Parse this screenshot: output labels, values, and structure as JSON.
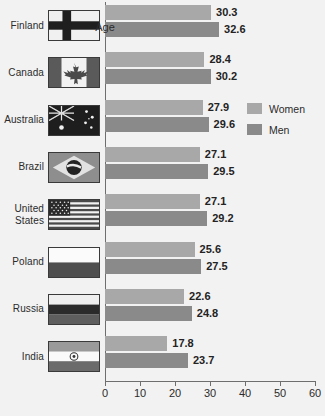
{
  "chart_data": {
    "type": "bar",
    "orientation": "horizontal",
    "title": "",
    "xlabel": "Age",
    "ylabel": "",
    "xlim": [
      0,
      60
    ],
    "xticks": [
      0,
      10,
      20,
      30,
      40,
      50,
      60
    ],
    "grid": false,
    "legend_position": "right-middle",
    "categories": [
      "Finland",
      "Canada",
      "Australia",
      "Brazil",
      "United States",
      "Poland",
      "Russia",
      "India"
    ],
    "series": [
      {
        "name": "Women",
        "color": "#a8a8a8",
        "values": [
          30.3,
          28.4,
          27.9,
          27.1,
          27.1,
          25.6,
          22.6,
          17.8
        ]
      },
      {
        "name": "Men",
        "color": "#8a8a8a",
        "values": [
          32.6,
          30.2,
          29.6,
          29.5,
          29.2,
          27.5,
          24.8,
          23.7
        ]
      }
    ]
  },
  "axis": {
    "x_title": "Age",
    "tick_labels": [
      "0",
      "10",
      "20",
      "30",
      "40",
      "50",
      "60"
    ]
  },
  "legend": {
    "items": [
      {
        "label": "Women",
        "color": "#a8a8a8"
      },
      {
        "label": "Men",
        "color": "#8a8a8a"
      }
    ]
  },
  "rows": [
    {
      "label": "Finland",
      "label_lines": [
        "Finland"
      ],
      "flag": "flag-finland",
      "women": "30.3",
      "men": "32.6"
    },
    {
      "label": "Canada",
      "label_lines": [
        "Canada"
      ],
      "flag": "flag-canada",
      "women": "28.4",
      "men": "30.2"
    },
    {
      "label": "Australia",
      "label_lines": [
        "Australia"
      ],
      "flag": "flag-australia",
      "women": "27.9",
      "men": "29.6"
    },
    {
      "label": "Brazil",
      "label_lines": [
        "Brazil"
      ],
      "flag": "flag-brazil",
      "women": "27.1",
      "men": "29.5"
    },
    {
      "label": "United States",
      "label_lines": [
        "United",
        "States"
      ],
      "flag": "flag-usa",
      "women": "27.1",
      "men": "29.2"
    },
    {
      "label": "Poland",
      "label_lines": [
        "Poland"
      ],
      "flag": "flag-poland",
      "women": "25.6",
      "men": "27.5"
    },
    {
      "label": "Russia",
      "label_lines": [
        "Russia"
      ],
      "flag": "flag-russia",
      "women": "22.6",
      "men": "24.8"
    },
    {
      "label": "India",
      "label_lines": [
        "India"
      ],
      "flag": "flag-india",
      "women": "17.8",
      "men": "23.7"
    }
  ],
  "colors": {
    "background": "#f2f2f2",
    "women_bar": "#a8a8a8",
    "men_bar": "#8a8a8a",
    "axis": "#6e6e6e",
    "text": "#2b2b2b"
  }
}
